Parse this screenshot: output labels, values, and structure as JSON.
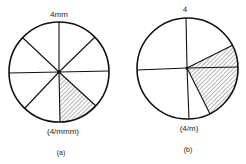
{
  "figure": {
    "a": {
      "top_label": "4mm",
      "bottom_label": "(4/mmm)",
      "caption": "(a)",
      "sectors": 8,
      "shaded_sector": "lower-right, between down and 45° lower-right spoke"
    },
    "b": {
      "top_label": "4",
      "bottom_label": "(4/m)",
      "caption": "(b)",
      "sectors": 6,
      "shaded_sector": "right, between upper-right and lower-right spokes"
    }
  },
  "colors": {
    "stroke": "#111111",
    "background": "#ffffff"
  }
}
